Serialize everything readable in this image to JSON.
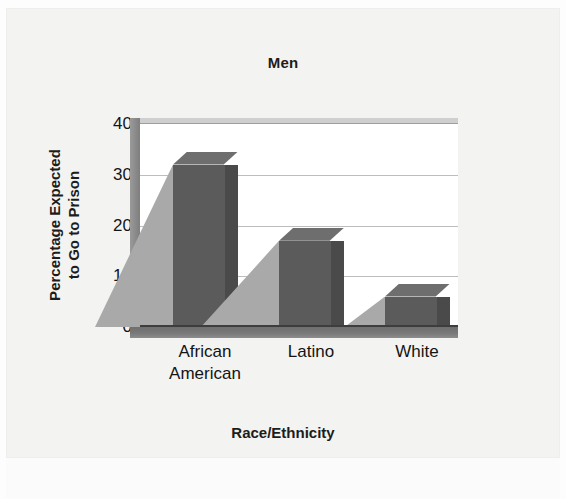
{
  "chart_data": {
    "type": "bar",
    "title": "Men",
    "xlabel": "Race/Ethnicity",
    "ylabel_line1": "Percentage Expected",
    "ylabel_line2": "to Go to Prison",
    "categories": [
      "African American",
      "Latino",
      "White"
    ],
    "category_lines": [
      [
        "African",
        "American"
      ],
      [
        "Latino"
      ],
      [
        "White"
      ]
    ],
    "values": [
      32,
      17,
      6
    ],
    "ylim": [
      0,
      40
    ],
    "yticks": [
      0,
      10,
      20,
      30,
      40
    ],
    "ytick_labels": [
      "0",
      "10",
      "20",
      "30",
      "40"
    ],
    "grid": true,
    "legend": "none",
    "style": "3d-bar",
    "colors": {
      "bar_face": "#5b5b5b",
      "bar_top": "#6e6e6e",
      "bar_side": "#4a4a4a",
      "bar_shadow": "#a9a9a9",
      "gridline": "#bdbdbd",
      "axis": "#3d3d3d",
      "plot_background": "#ffffff",
      "page_background": "#f3f3f2",
      "text": "#141414"
    }
  }
}
